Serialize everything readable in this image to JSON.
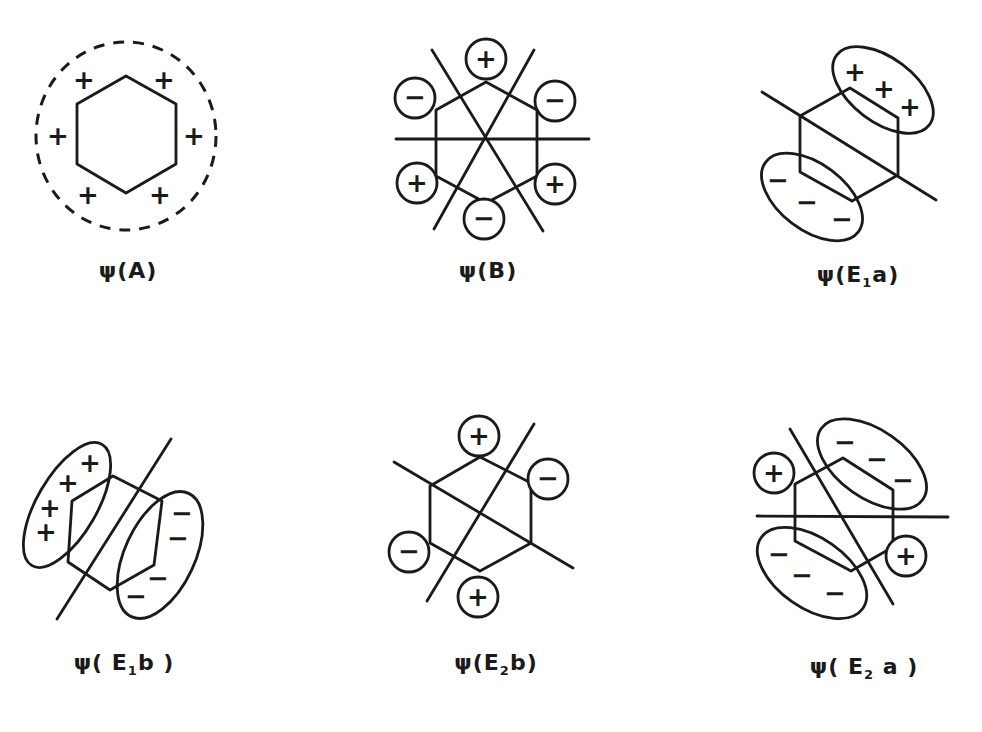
{
  "figure": {
    "panels": [
      {
        "id": "A",
        "label_prefix": "ψ(",
        "label_main": "A",
        "label_sub": "",
        "label_suffix": ")",
        "signs": [
          "+",
          "+",
          "+",
          "+",
          "+",
          "+"
        ],
        "nodes": 0
      },
      {
        "id": "B",
        "label_prefix": "ψ(",
        "label_main": "B",
        "label_sub": "",
        "label_suffix": ")",
        "signs": [
          "+",
          "−",
          "+",
          "−",
          "+",
          "−"
        ],
        "nodes": 3
      },
      {
        "id": "E1a",
        "label_prefix": "ψ(",
        "label_main": "E",
        "label_sub": "1",
        "label_tail": "a",
        "label_suffix": ")",
        "signs": [
          "+",
          "+",
          "+",
          "−",
          "−",
          "−"
        ],
        "nodes": 1
      },
      {
        "id": "E1b",
        "label_prefix": "ψ( ",
        "label_main": "E",
        "label_sub": "1",
        "label_tail": "b",
        "label_suffix": " )",
        "signs": [
          "+",
          "+",
          "+",
          "+",
          "−",
          "−",
          "−",
          "−"
        ],
        "nodes": 1
      },
      {
        "id": "E2b",
        "label_prefix": "ψ(",
        "label_main": "E",
        "label_sub": "2",
        "label_tail": "b",
        "label_suffix": ")",
        "signs": [
          "+",
          "−",
          "+",
          "−"
        ],
        "nodes": 2
      },
      {
        "id": "E2a",
        "label_prefix": "ψ( ",
        "label_main": "E",
        "label_sub": "2",
        "label_tail": " a",
        "label_suffix": " )",
        "signs": [
          "+",
          "−",
          "−",
          "−",
          "+",
          "−",
          "−",
          "−"
        ],
        "nodes": 2
      }
    ]
  }
}
